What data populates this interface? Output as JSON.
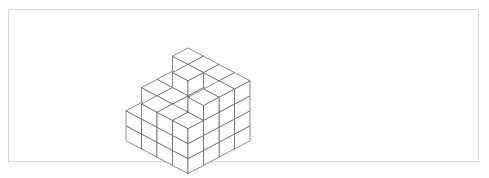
{
  "figure": {
    "title": "",
    "kind": "isometric-cube-stack",
    "frame": {
      "stroke_color": "#d8d8d8",
      "fill_color": "#ffffff",
      "x": 8,
      "y": 9,
      "width": 471,
      "height": 153
    },
    "line_color": "#585858",
    "face_fill": "#ffffff",
    "background_color": "#ffffff"
  },
  "chart_data": {
    "type": "heatmap",
    "title": "",
    "subtitle": "",
    "xlabel": "",
    "ylabel": "",
    "legend": [],
    "annotations": [],
    "grid": true,
    "axis_ranges": {
      "columns": [
        0,
        4
      ],
      "rows": [
        0,
        4
      ],
      "height": [
        0,
        4
      ]
    },
    "tick_labels": {
      "columns": [
        "1",
        "2",
        "3",
        "4"
      ],
      "rows": [
        "1",
        "2",
        "3",
        "4"
      ],
      "heights": [
        "0",
        "1",
        "2",
        "3",
        "4"
      ]
    },
    "categories": [
      "col 1",
      "col 2",
      "col 3",
      "col 4"
    ],
    "series": [
      {
        "name": "row 1 (back)",
        "values": [
          4,
          4,
          4,
          4
        ]
      },
      {
        "name": "row 2",
        "values": [
          3,
          4,
          3,
          4
        ]
      },
      {
        "name": "row 3",
        "values": [
          3,
          3,
          2,
          4
        ]
      },
      {
        "name": "row 4 (front)",
        "values": [
          2,
          3,
          3,
          3
        ]
      }
    ],
    "total_cubes": 52
  },
  "geometry": {
    "origin_x": 188,
    "origin_y": 108,
    "tile_width": 15.5,
    "tile_height": 8.2,
    "cube_height": 15.0,
    "rows": 4,
    "cols": 4,
    "heights": [
      [
        4,
        4,
        4,
        4
      ],
      [
        3,
        4,
        3,
        4
      ],
      [
        3,
        3,
        2,
        4
      ],
      [
        2,
        3,
        3,
        3
      ]
    ]
  }
}
